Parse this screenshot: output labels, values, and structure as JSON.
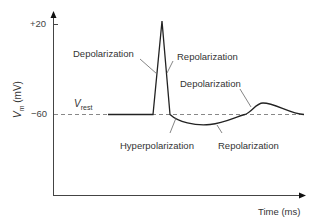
{
  "diagram": {
    "title": "",
    "y_axis": {
      "symbol": "V",
      "subscript": "m",
      "unit": " (mV)",
      "ticks": [
        {
          "label": "+20",
          "value": 20
        },
        {
          "label": "−60",
          "value": -60
        }
      ]
    },
    "x_axis": {
      "label": "Time (ms)"
    },
    "resting_line": {
      "symbol": "V",
      "subscript": "rest",
      "style": "dashed"
    },
    "annotations": [
      {
        "id": "depolarization-1",
        "text": "Depolarization"
      },
      {
        "id": "repolarization-1",
        "text": "Repolarization"
      },
      {
        "id": "depolarization-2",
        "text": "Depolarization"
      },
      {
        "id": "hyperpolarization",
        "text": "Hyperpolarization"
      },
      {
        "id": "repolarization-2",
        "text": "Repolarization"
      }
    ],
    "colors": {
      "curve": "#222222",
      "axis": "#444444",
      "dashed": "#777777",
      "leader": "#666666"
    }
  }
}
